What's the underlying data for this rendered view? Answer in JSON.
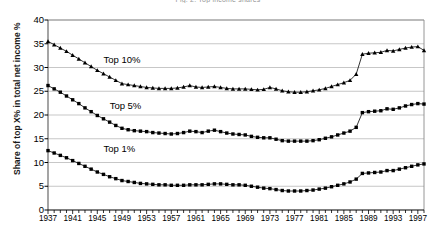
{
  "chart_data": {
    "type": "line",
    "title": "Fig. 2. Top income shares",
    "xlabel": "",
    "ylabel": "Share of top X% in total net income %",
    "ylim": [
      0,
      40
    ],
    "ytick_step": 5,
    "yticks": [
      0,
      5,
      10,
      15,
      20,
      25,
      30,
      35,
      40
    ],
    "xlim": [
      1937,
      1998
    ],
    "xticks": [
      1937,
      1941,
      1945,
      1949,
      1953,
      1957,
      1961,
      1965,
      1969,
      1973,
      1977,
      1981,
      1985,
      1989,
      1993,
      1997
    ],
    "grid": "horizontal",
    "legend_position": "inline-annotations",
    "x": [
      1937,
      1938,
      1939,
      1940,
      1941,
      1942,
      1943,
      1944,
      1945,
      1946,
      1947,
      1948,
      1949,
      1950,
      1951,
      1952,
      1953,
      1954,
      1955,
      1956,
      1957,
      1958,
      1959,
      1960,
      1961,
      1962,
      1963,
      1964,
      1965,
      1966,
      1967,
      1968,
      1969,
      1970,
      1971,
      1972,
      1973,
      1974,
      1975,
      1976,
      1977,
      1978,
      1979,
      1980,
      1981,
      1982,
      1983,
      1984,
      1985,
      1986,
      1987,
      1988,
      1989,
      1990,
      1991,
      1992,
      1993,
      1994,
      1995,
      1996,
      1997,
      1998
    ],
    "series": [
      {
        "name": "Top 10%",
        "marker": "triangle",
        "values": [
          35.5,
          34.8,
          34.1,
          33.4,
          32.6,
          31.8,
          31.0,
          30.2,
          29.4,
          28.7,
          28.0,
          27.3,
          26.6,
          26.4,
          26.2,
          26.0,
          25.8,
          25.7,
          25.6,
          25.6,
          25.6,
          25.7,
          25.9,
          26.2,
          25.9,
          25.8,
          25.9,
          26.0,
          25.8,
          25.6,
          25.5,
          25.5,
          25.5,
          25.4,
          25.3,
          25.4,
          25.8,
          25.5,
          25.1,
          24.9,
          24.8,
          24.8,
          24.9,
          25.1,
          25.3,
          25.6,
          26.0,
          26.4,
          26.8,
          27.3,
          28.6,
          32.8,
          33.0,
          33.1,
          33.2,
          33.6,
          33.5,
          33.8,
          34.1,
          34.3,
          34.4,
          33.6
        ]
      },
      {
        "name": "Top 5%",
        "marker": "square",
        "values": [
          26.2,
          25.5,
          24.8,
          24.0,
          23.2,
          22.4,
          21.5,
          20.7,
          19.9,
          19.2,
          18.5,
          17.8,
          17.2,
          16.9,
          16.7,
          16.6,
          16.5,
          16.3,
          16.2,
          16.1,
          16.0,
          16.1,
          16.3,
          16.6,
          16.5,
          16.3,
          16.6,
          16.8,
          16.5,
          16.2,
          16.0,
          15.9,
          15.8,
          15.5,
          15.3,
          15.2,
          15.2,
          14.9,
          14.6,
          14.5,
          14.5,
          14.5,
          14.5,
          14.6,
          14.8,
          15.1,
          15.4,
          15.8,
          16.2,
          16.6,
          17.4,
          20.5,
          20.7,
          20.8,
          20.9,
          21.3,
          21.2,
          21.5,
          21.9,
          22.2,
          22.4,
          22.3
        ]
      },
      {
        "name": "Top 1%",
        "marker": "square",
        "values": [
          12.5,
          12.0,
          11.5,
          11.0,
          10.4,
          9.8,
          9.2,
          8.6,
          8.0,
          7.5,
          7.0,
          6.6,
          6.2,
          6.0,
          5.8,
          5.6,
          5.5,
          5.4,
          5.3,
          5.3,
          5.2,
          5.2,
          5.2,
          5.3,
          5.3,
          5.3,
          5.4,
          5.5,
          5.5,
          5.4,
          5.3,
          5.3,
          5.2,
          5.0,
          4.8,
          4.6,
          4.5,
          4.3,
          4.1,
          4.0,
          4.0,
          4.0,
          4.1,
          4.2,
          4.4,
          4.6,
          4.9,
          5.2,
          5.5,
          5.9,
          6.5,
          7.7,
          7.8,
          7.9,
          8.0,
          8.3,
          8.3,
          8.6,
          8.9,
          9.2,
          9.5,
          9.7
        ]
      }
    ],
    "annotations": [
      {
        "text": "Top 10%",
        "x": 1946,
        "y": 31.5
      },
      {
        "text": "Top 5%",
        "x": 1947,
        "y": 22.0
      },
      {
        "text": "Top 1%",
        "x": 1946,
        "y": 12.8
      }
    ]
  }
}
